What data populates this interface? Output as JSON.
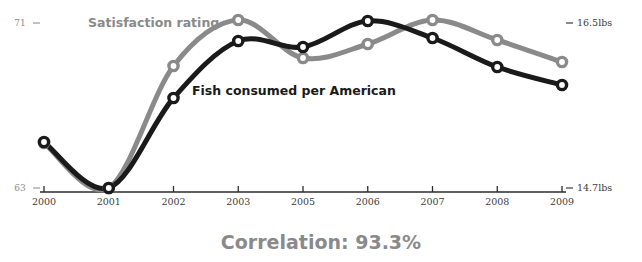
{
  "chart_data": {
    "type": "line",
    "title": "",
    "caption": "Correlation: 93.3%",
    "xlabel": "",
    "grid": false,
    "legend_position": "inline-annotation",
    "categories": [
      "2000",
      "2001",
      "2002",
      "2003",
      "2005",
      "2006",
      "2007",
      "2008",
      "2009"
    ],
    "x_tick_labels": [
      "2000",
      "2001",
      "2002",
      "2003",
      "2005",
      "2006",
      "2007",
      "2008",
      "2009"
    ],
    "left_axis": {
      "label": "Satisfaction rating",
      "ticks": [
        "71",
        "63"
      ],
      "max_label": "71",
      "min_label": "63",
      "ylim": [
        63,
        71
      ]
    },
    "right_axis": {
      "label": "Fish consumed per American",
      "ticks": [
        "16.5lbs",
        "14.7lbs"
      ],
      "max_label": "16.5lbs",
      "min_label": "14.7lbs",
      "ylim": [
        14.7,
        16.5
      ]
    },
    "series": [
      {
        "name": "Satisfaction rating",
        "color": "#8a8a8a",
        "axis": "left",
        "unit": "",
        "values": [
          65.2,
          63.0,
          68.9,
          71.1,
          69.3,
          70.0,
          71.1,
          70.1,
          69.0
        ],
        "pixel_y": [
          143,
          188,
          66,
          20,
          58,
          44,
          20,
          40,
          62
        ]
      },
      {
        "name": "Fish consumed per American",
        "color": "#1a1a1a",
        "axis": "right",
        "unit": "lbs",
        "values": [
          15.26,
          14.7,
          15.68,
          16.3,
          16.23,
          16.51,
          16.33,
          16.02,
          15.83
        ],
        "pixel_y": [
          142,
          188,
          98,
          41,
          47,
          21,
          38,
          67,
          85
        ]
      }
    ],
    "labels": {
      "gray_series_annotation": "Satisfaction rating",
      "black_series_annotation": "Fish consumed per American"
    }
  }
}
